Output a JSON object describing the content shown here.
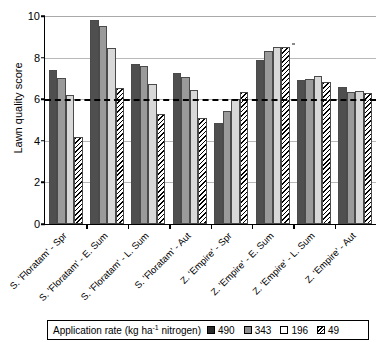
{
  "chart_data": {
    "type": "bar",
    "title": "",
    "xlabel": "",
    "ylabel": "Lawn quality score",
    "ylim": [
      0,
      10
    ],
    "yticks": [
      0,
      2,
      4,
      6,
      8,
      10
    ],
    "grid": true,
    "legend_position": "bottom",
    "legend_title": "Application rate (kg ha",
    "legend_title_sup": "-1",
    "legend_title_tail": " nitrogen)",
    "reference_line": {
      "value": 6,
      "style": "dashed",
      "color": "#000000"
    },
    "categories": [
      "S. 'Floratam' - Spr",
      "S. 'Floratam' - E. Sum",
      "S. 'Floratam' - L. Sum",
      "S. 'Floratam' - Aut",
      "Z. 'Empire' - Spr",
      "Z. 'Empire' - E. Sum",
      "Z. 'Empire' - L. Sum",
      "Z. 'Empire' - Aut"
    ],
    "series": [
      {
        "name": "490",
        "color": "#4f4f4f",
        "pattern": "solid-dark",
        "values": [
          7.4,
          9.8,
          7.7,
          7.25,
          4.85,
          7.9,
          6.9,
          6.6
        ]
      },
      {
        "name": "343",
        "color": "#9a9a9a",
        "pattern": "solid-mid-gray",
        "values": [
          7.0,
          9.5,
          7.6,
          7.05,
          5.45,
          8.3,
          6.95,
          6.35
        ]
      },
      {
        "name": "196",
        "color": "#d8d8d8",
        "pattern": "solid-light-gray",
        "values": [
          6.2,
          8.45,
          6.75,
          6.45,
          6.0,
          8.5,
          7.1,
          6.4
        ]
      },
      {
        "name": "49",
        "color": "#ffffff",
        "pattern": "diagonal-hatch",
        "values": [
          4.2,
          6.55,
          5.3,
          5.1,
          6.35,
          8.5,
          6.85,
          6.3
        ]
      }
    ]
  },
  "axis": {
    "y_title": "Lawn quality score",
    "y_tick_labels": [
      "0",
      "2",
      "4",
      "6",
      "8",
      "10"
    ]
  },
  "legend": {
    "title_main": "Application rate (kg ha",
    "title_sup": "-1",
    "title_tail": " nitrogen)",
    "entries": [
      {
        "label": "490"
      },
      {
        "label": "343"
      },
      {
        "label": "196"
      },
      {
        "label": "49"
      }
    ]
  }
}
